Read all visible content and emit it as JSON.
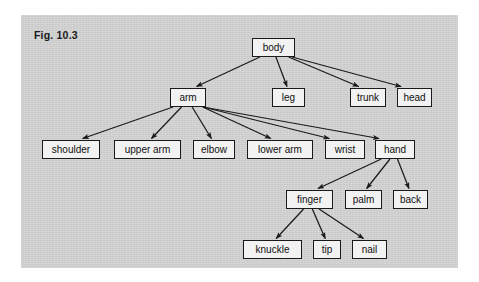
{
  "figure": {
    "label": "Fig. 10.3",
    "panel_color": "#d3d3d3",
    "node_fill": "#f2f2f2",
    "node_border": "#1a1a1a",
    "edge_color": "#1a1a1a"
  },
  "diagram": {
    "type": "tree",
    "title": "Fig. 10.3",
    "root": "body",
    "nodes": [
      {
        "id": "body",
        "label": "body",
        "x": 252,
        "y": 38,
        "w": 43
      },
      {
        "id": "arm",
        "label": "arm",
        "x": 170,
        "y": 88,
        "w": 36
      },
      {
        "id": "leg",
        "label": "leg",
        "x": 272,
        "y": 88,
        "w": 33
      },
      {
        "id": "trunk",
        "label": "trunk",
        "x": 350,
        "y": 88,
        "w": 36
      },
      {
        "id": "head",
        "label": "head",
        "x": 397,
        "y": 88,
        "w": 35
      },
      {
        "id": "shoulder",
        "label": "shoulder",
        "x": 42,
        "y": 140,
        "w": 58
      },
      {
        "id": "upper_arm",
        "label": "upper arm",
        "x": 114,
        "y": 140,
        "w": 67
      },
      {
        "id": "elbow",
        "label": "elbow",
        "x": 193,
        "y": 140,
        "w": 42
      },
      {
        "id": "lower_arm",
        "label": "lower arm",
        "x": 247,
        "y": 140,
        "w": 66
      },
      {
        "id": "wrist",
        "label": "wrist",
        "x": 325,
        "y": 140,
        "w": 40
      },
      {
        "id": "hand",
        "label": "hand",
        "x": 375,
        "y": 140,
        "w": 40
      },
      {
        "id": "finger",
        "label": "finger",
        "x": 286,
        "y": 190,
        "w": 47
      },
      {
        "id": "palm",
        "label": "palm",
        "x": 345,
        "y": 190,
        "w": 37
      },
      {
        "id": "back",
        "label": "back",
        "x": 393,
        "y": 190,
        "w": 35
      },
      {
        "id": "knuckle",
        "label": "knuckle",
        "x": 243,
        "y": 240,
        "w": 59
      },
      {
        "id": "tip",
        "label": "tip",
        "x": 313,
        "y": 240,
        "w": 28
      },
      {
        "id": "nail",
        "label": "nail",
        "x": 352,
        "y": 240,
        "w": 35
      }
    ],
    "edges": [
      {
        "from": "body",
        "to": "arm"
      },
      {
        "from": "body",
        "to": "leg"
      },
      {
        "from": "body",
        "to": "trunk"
      },
      {
        "from": "body",
        "to": "head"
      },
      {
        "from": "arm",
        "to": "shoulder"
      },
      {
        "from": "arm",
        "to": "upper_arm"
      },
      {
        "from": "arm",
        "to": "elbow"
      },
      {
        "from": "arm",
        "to": "lower_arm"
      },
      {
        "from": "arm",
        "to": "wrist"
      },
      {
        "from": "arm",
        "to": "hand"
      },
      {
        "from": "hand",
        "to": "finger"
      },
      {
        "from": "hand",
        "to": "palm"
      },
      {
        "from": "hand",
        "to": "back"
      },
      {
        "from": "finger",
        "to": "knuckle"
      },
      {
        "from": "finger",
        "to": "tip"
      },
      {
        "from": "finger",
        "to": "nail"
      }
    ]
  }
}
